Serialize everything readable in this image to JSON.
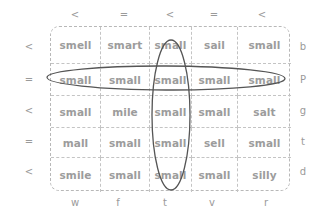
{
  "top_labels": [
    "<",
    "=",
    "<",
    "=",
    "<"
  ],
  "left_labels": [
    "<",
    "=",
    "<",
    "=",
    "<"
  ],
  "right_labels": [
    "b",
    "P",
    "g",
    "t",
    "d"
  ],
  "bottom_labels": [
    "w",
    "f",
    "t",
    "v",
    "r"
  ],
  "grid": {
    "rows": [
      [
        "smell",
        "smart",
        "small",
        "sail",
        "small"
      ],
      [
        "small",
        "small",
        "small",
        "small",
        "small"
      ],
      [
        "small",
        "mile",
        "small",
        "small",
        "salt"
      ],
      [
        "mall",
        "small",
        "small",
        "sell",
        "small"
      ],
      [
        "smile",
        "small",
        "small",
        "small",
        "silly"
      ]
    ]
  },
  "highlights": {
    "row_ellipse": {
      "row": 2,
      "stroke": "#555555"
    },
    "column_ellipse": {
      "column": 3,
      "stroke": "#555555"
    }
  },
  "colors": {
    "text": "#9c9c9c",
    "border": "#c4c4c4",
    "ellipse": "#555555"
  }
}
